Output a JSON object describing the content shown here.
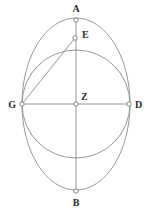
{
  "figure": {
    "canvas": {
      "width": 153,
      "height": 216
    },
    "colors": {
      "stroke": "#8a8a8a",
      "label": "#2b2b2b",
      "marker_fill": "#ffffff",
      "marker_stroke": "#777777",
      "background": "#ffffff"
    },
    "center": {
      "name": "Z",
      "x": 76,
      "y": 104
    },
    "points": [
      {
        "id": "A",
        "label": "A",
        "x": 76,
        "y": 20,
        "label_x": 76,
        "label_y": 12,
        "marker": true
      },
      {
        "id": "E",
        "label": "E",
        "x": 75,
        "y": 38,
        "label_x": 82,
        "label_y": 38,
        "marker": true
      },
      {
        "id": "Z",
        "label": "Z",
        "x": 76,
        "y": 104,
        "label_x": 81,
        "label_y": 100,
        "marker": true
      },
      {
        "id": "G",
        "label": "G",
        "x": 22,
        "y": 104,
        "label_x": 16,
        "label_y": 108,
        "marker": true
      },
      {
        "id": "D",
        "label": "D",
        "x": 129,
        "y": 104,
        "label_x": 135,
        "label_y": 108,
        "marker": true
      },
      {
        "id": "B",
        "label": "B",
        "x": 76,
        "y": 191,
        "label_x": 76,
        "label_y": 206,
        "marker": true
      }
    ],
    "shapes": [
      {
        "id": "outer-ellipse",
        "type": "ellipse",
        "cx": 76,
        "cy": 104,
        "rx": 54,
        "ry": 86,
        "note": "outer ellipse through A, G, D, B"
      },
      {
        "id": "inner-circle",
        "type": "circle",
        "cx": 76,
        "cy": 104,
        "r": 54,
        "note": "circle centered at Z through G and D"
      }
    ],
    "segments": [
      {
        "id": "vertical-axis",
        "from": "A",
        "to": "B",
        "x1": 76,
        "y1": 20,
        "x2": 76,
        "y2": 191
      },
      {
        "id": "horizontal-axis",
        "from": "G",
        "to": "D",
        "x1": 22,
        "y1": 104,
        "x2": 129,
        "y2": 104
      },
      {
        "id": "chord-GE",
        "from": "G",
        "to": "E",
        "x1": 22,
        "y1": 104,
        "x2": 75,
        "y2": 38
      }
    ]
  }
}
